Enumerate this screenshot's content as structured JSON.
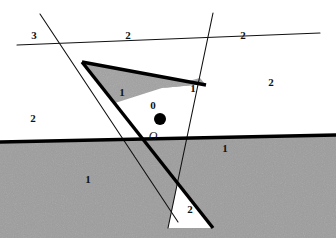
{
  "figure": {
    "width": 336,
    "height": 238,
    "background_color": "#ffffff",
    "shade_color": "#9d9d9d",
    "shade_color_light": "#a8a8a8",
    "line_color": "#000000",
    "label_color": "#111111",
    "thick_line_width": 3.2,
    "thin_line_width": 1.0
  },
  "origin": {
    "label": "O",
    "dot_x": 160,
    "dot_y": 119,
    "dot_radius": 6,
    "label_x": 153,
    "label_y": 136,
    "dot_color": "#000000"
  },
  "region_labels": [
    {
      "id": "label-3-upper-left",
      "text": "3",
      "x": 34,
      "y": 35
    },
    {
      "id": "label-2-top-center",
      "text": "2",
      "x": 128,
      "y": 35
    },
    {
      "id": "label-2-top-right",
      "text": "2",
      "x": 243,
      "y": 35
    },
    {
      "id": "label-2-right-upper",
      "text": "2",
      "x": 271,
      "y": 82
    },
    {
      "id": "label-2-left-upper",
      "text": "2",
      "x": 33,
      "y": 118
    },
    {
      "id": "label-1-wedge-left",
      "text": "1",
      "x": 122,
      "y": 92
    },
    {
      "id": "label-1-wedge-right",
      "text": "1",
      "x": 193,
      "y": 88
    },
    {
      "id": "label-0-center",
      "text": "0",
      "x": 153,
      "y": 105
    },
    {
      "id": "label-1-lower-left",
      "text": "1",
      "x": 88,
      "y": 179
    },
    {
      "id": "label-1-lower-right",
      "text": "1",
      "x": 225,
      "y": 148
    },
    {
      "id": "label-2-bottom",
      "text": "2",
      "x": 190,
      "y": 209
    }
  ],
  "vertices": {
    "left_apex": {
      "x": 82,
      "y": 62
    },
    "center_cross": {
      "x": 162,
      "y": 88
    },
    "right_apex": {
      "x": 200,
      "y": 78
    },
    "left_mid_cross": {
      "x": 115,
      "y": 103
    },
    "bottom_cross": {
      "x": 178,
      "y": 182
    }
  },
  "lines": [
    {
      "id": "thin-line-upper-steep",
      "style": "thin",
      "from_x": 40,
      "from_y": 14,
      "to_x": 178,
      "to_y": 222
    },
    {
      "id": "thin-line-upper-shallow",
      "style": "thin",
      "from_x": 17,
      "from_y": 45,
      "to_x": 320,
      "to_y": 33
    },
    {
      "id": "thin-line-right-steep",
      "style": "thin",
      "from_x": 213,
      "from_y": 13,
      "to_x": 168,
      "to_y": 228
    },
    {
      "id": "thick-line-left-ridge",
      "style": "thick",
      "from_x": 0,
      "from_y": 142,
      "to_x": 336,
      "to_y": 135
    },
    {
      "id": "thick-line-apex-to-bottom",
      "style": "thick",
      "from_x": 82,
      "from_y": 62,
      "to_x": 213,
      "to_y": 228
    },
    {
      "id": "thick-line-apex-to-right",
      "style": "thick",
      "from_x": 82,
      "from_y": 62,
      "to_x": 205,
      "to_y": 84
    }
  ]
}
